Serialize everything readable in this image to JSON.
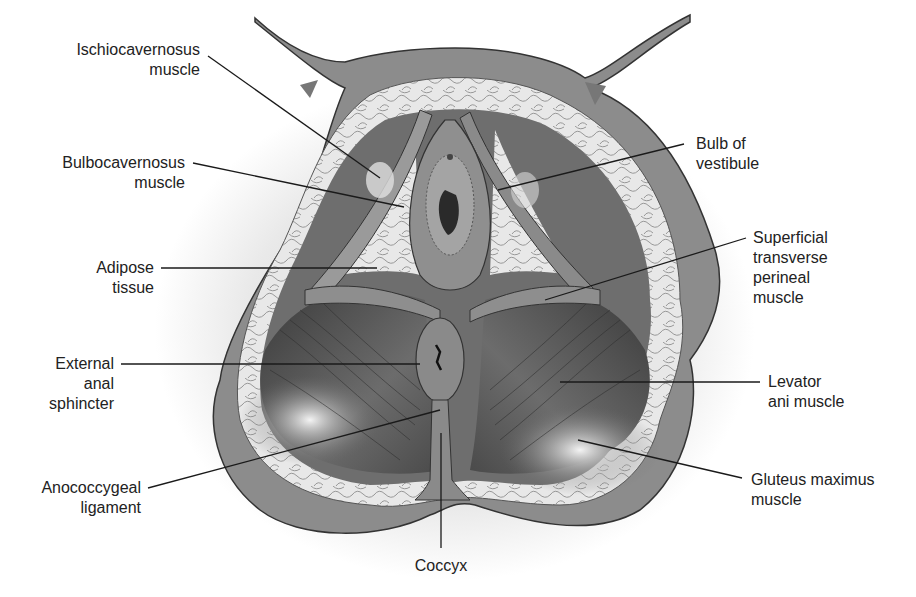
{
  "diagram": {
    "colors": {
      "background": "#ffffff",
      "skin": "#8a8a8a",
      "adipose": "#e6e6e6",
      "muscle_dark": "#4a4a4a",
      "muscle_mid": "#7a7a7a",
      "label_text": "#222222",
      "leader_line": "#1a1a1a"
    },
    "labels": {
      "ischiocavernosus": {
        "line1": "Ischiocavernosus",
        "line2": "muscle"
      },
      "bulbocavernosus": {
        "line1": "Bulbocavernosus",
        "line2": "muscle"
      },
      "adipose": {
        "line1": "Adipose",
        "line2": "tissue"
      },
      "external_anal": {
        "line1": "External",
        "line2": "anal",
        "line3": "sphincter"
      },
      "anococcygeal": {
        "line1": "Anococcygeal",
        "line2": "ligament"
      },
      "coccyx": {
        "line1": "Coccyx"
      },
      "bulb_vestibule": {
        "line1": "Bulb of",
        "line2": "vestibule"
      },
      "superficial_transverse": {
        "line1": "Superficial",
        "line2": "transverse",
        "line3": "perineal",
        "line4": "muscle"
      },
      "levator_ani": {
        "line1": "Levator",
        "line2": "ani muscle"
      },
      "gluteus_maximus": {
        "line1": "Gluteus maximus",
        "line2": "muscle"
      }
    }
  }
}
